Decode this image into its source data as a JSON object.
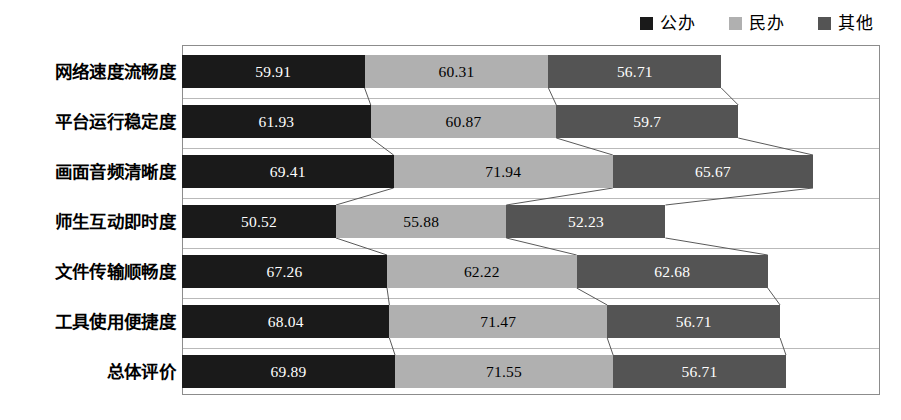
{
  "legend": {
    "position": "top-right",
    "items": [
      {
        "label": "公办",
        "color": "#1a1a1a",
        "icon": "square-swatch-icon"
      },
      {
        "label": "民办",
        "color": "#b0b0b0",
        "icon": "square-swatch-icon"
      },
      {
        "label": "其他",
        "color": "#545454",
        "icon": "square-swatch-icon"
      }
    ]
  },
  "chart_data": {
    "type": "bar",
    "orientation": "horizontal",
    "stacked": true,
    "title": "",
    "subtitle": "",
    "xlabel": "",
    "ylabel": "",
    "grid": true,
    "legend_position": "top-right",
    "xlim": [
      0,
      229
    ],
    "categories": [
      "网络速度流畅度",
      "平台运行稳定度",
      "画面音频清晰度",
      "师生互动即时度",
      "文件传输顺畅度",
      "工具使用便捷度",
      "总体评价"
    ],
    "series": [
      {
        "name": "公办",
        "color": "#1a1a1a",
        "values": [
          59.91,
          61.93,
          69.41,
          50.52,
          67.26,
          68.04,
          69.89
        ]
      },
      {
        "name": "民办",
        "color": "#b0b0b0",
        "values": [
          60.31,
          60.87,
          71.94,
          55.88,
          62.22,
          71.47,
          71.55
        ]
      },
      {
        "name": "其他",
        "color": "#545454",
        "values": [
          56.71,
          59.7,
          65.67,
          52.23,
          62.68,
          56.71,
          56.71
        ]
      }
    ],
    "data_labels": [
      [
        "59.91",
        "60.31",
        "56.71"
      ],
      [
        "61.93",
        "60.87",
        "59.7"
      ],
      [
        "69.41",
        "71.94",
        "65.67"
      ],
      [
        "50.52",
        "55.88",
        "52.23"
      ],
      [
        "67.26",
        "62.22",
        "62.68"
      ],
      [
        "68.04",
        "71.47",
        "56.71"
      ],
      [
        "69.89",
        "71.55",
        "56.71"
      ]
    ],
    "connectors": true
  }
}
